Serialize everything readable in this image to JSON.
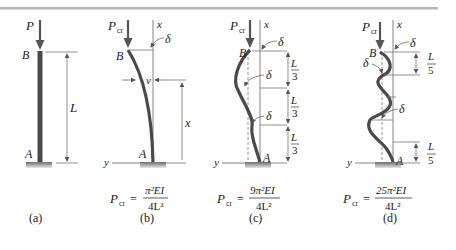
{
  "figure": {
    "top_rule_color": "#b5b5b5",
    "column_color": "#4a4a4a",
    "line_color": "#555555",
    "base_color": "#8a8a8a",
    "panels": [
      {
        "id": "a",
        "caption": "(a)",
        "load_label": "P",
        "top_label": "B",
        "bottom_label": "A",
        "length_label": "L"
      },
      {
        "id": "b",
        "caption": "(b)",
        "load_label": "P",
        "load_sub": "cr",
        "axis_x_label": "x",
        "axis_y_label": "y",
        "top_label": "B",
        "bottom_label": "A",
        "deflection_label": "δ",
        "v_label": "v",
        "x_dim_label": "x",
        "formula": {
          "lhs": "P",
          "lhs_sub": "cr",
          "eq": "=",
          "num": "π²EI",
          "den": "4L²"
        }
      },
      {
        "id": "c",
        "caption": "(c)",
        "load_label": "P",
        "load_sub": "cr",
        "axis_x_label": "x",
        "axis_y_label": "y",
        "top_label": "B",
        "bottom_label": "A",
        "deflection_labels": [
          "δ",
          "δ",
          "δ"
        ],
        "segment_labels": [
          {
            "num": "L",
            "den": "3"
          },
          {
            "num": "L",
            "den": "3"
          },
          {
            "num": "L",
            "den": "3"
          }
        ],
        "formula": {
          "lhs": "P",
          "lhs_sub": "cr",
          "eq": "=",
          "num": "9π²EI",
          "den": "4L²"
        }
      },
      {
        "id": "d",
        "caption": "(d)",
        "load_label": "P",
        "load_sub": "cr",
        "axis_x_label": "x",
        "axis_y_label": "y",
        "top_label": "B",
        "bottom_label": "A",
        "deflection_labels": [
          "δ",
          "δ",
          "δ"
        ],
        "segment_labels": [
          {
            "num": "L",
            "den": "5"
          },
          {
            "num": "L",
            "den": "5"
          }
        ],
        "formula": {
          "lhs": "P",
          "lhs_sub": "cr",
          "eq": "=",
          "num": "25π²EI",
          "den": "4L²"
        }
      }
    ]
  }
}
